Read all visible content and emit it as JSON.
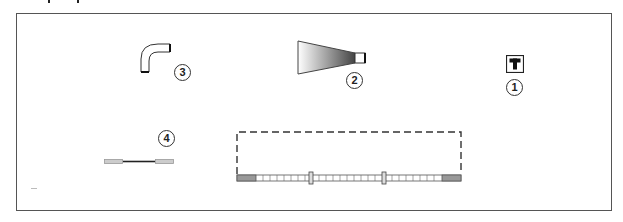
{
  "diagram": {
    "type": "parts-callout-diagram",
    "border_color": "#555555",
    "parts": [
      {
        "id": "elbow-pipe",
        "callout": "3",
        "shape": "elbow-pipe"
      },
      {
        "id": "tapered-nozzle",
        "callout": "2",
        "shape": "tapered-nozzle",
        "gradient_from": "#ffffff",
        "gradient_to": "#444444"
      },
      {
        "id": "tee-fitting",
        "callout": "1",
        "shape": "tee-box",
        "glyph": "T"
      },
      {
        "id": "connector-cable",
        "callout": "4",
        "shape": "cable-with-end-sleeves"
      },
      {
        "id": "segmented-bar",
        "callout": "",
        "shape": "segmented-bar-with-dashed-outline",
        "segments": 26,
        "clip_markers": 2
      }
    ]
  }
}
